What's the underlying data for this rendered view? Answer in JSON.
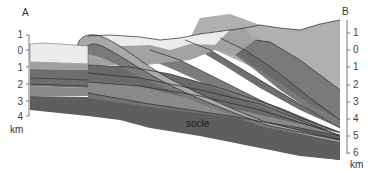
{
  "diagram": {
    "type": "geological-cross-section",
    "endpoints": {
      "left": "A",
      "right": "B"
    },
    "unit": "km",
    "left_axis": {
      "ticks": [
        "1",
        "0",
        "1",
        "2",
        "3",
        "4"
      ]
    },
    "right_axis": {
      "ticks": [
        "1",
        "0",
        "1",
        "2",
        "3",
        "4",
        "5",
        "6"
      ]
    },
    "labels": {
      "basement": "socle"
    },
    "colors": {
      "surface_light": "#ececec",
      "upper_grey": "#b4b4b4",
      "mid_grey": "#8e8e8e",
      "dark_grey": "#6e6e6e",
      "socle": "#5e5e5e",
      "line": "#2a2a2a"
    }
  }
}
